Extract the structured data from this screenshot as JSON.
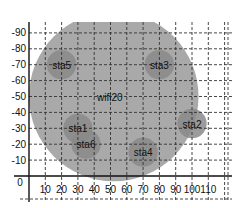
{
  "chart_data": {
    "type": "scatter",
    "title": "",
    "xlabel": "",
    "ylabel": "",
    "xlim": [
      0,
      115
    ],
    "ylim": [
      0,
      95
    ],
    "grid": true,
    "x_ticks": [
      "0",
      "10",
      "20",
      "30",
      "40",
      "50",
      "60",
      "70",
      "80",
      "90",
      "100",
      "110"
    ],
    "y_ticks": [
      "10",
      "20",
      "30",
      "40",
      "50",
      "60",
      "70",
      "80",
      "90"
    ],
    "access_point": {
      "name": "wifi20",
      "x": 52,
      "y": 50,
      "range": 52,
      "color": "#a9a9a9"
    },
    "stations": [
      {
        "name": "sta1",
        "x": 30,
        "y": 30
      },
      {
        "name": "sta2",
        "x": 100,
        "y": 33
      },
      {
        "name": "sta3",
        "x": 80,
        "y": 70
      },
      {
        "name": "sta4",
        "x": 70,
        "y": 15
      },
      {
        "name": "sta5",
        "x": 20,
        "y": 70
      },
      {
        "name": "sta6",
        "x": 35,
        "y": 20
      }
    ],
    "station_range": 9,
    "station_color": "#8a8a8a"
  }
}
